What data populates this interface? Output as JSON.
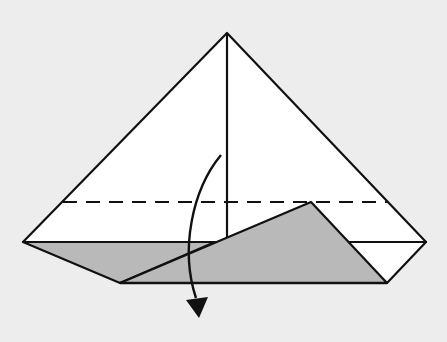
{
  "diagram": {
    "colors": {
      "background": "#ededed",
      "paper": "#ffffff",
      "shaded": "#b8b8b8",
      "line": "#111111"
    },
    "elements": {
      "paper_body": "Triangular paper with top point",
      "center_crease": "Vertical center crease",
      "fold_line": "Dashed valley fold line",
      "shaded_flap_left": "Shaded back layer on left",
      "shaded_flap_front": "Shaded front flap",
      "right_triangle_flap": "White lower right flap",
      "fold_arrow": "Curved arrow indicating fold down"
    }
  }
}
